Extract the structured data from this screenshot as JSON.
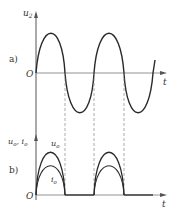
{
  "figure": {
    "panel_a": {
      "label": "a)",
      "y_axis_label": "u",
      "y_axis_sub": "2",
      "x_axis_label": "t",
      "origin_label": "O"
    },
    "panel_b": {
      "label": "b)",
      "y_axis_label": "u",
      "y_axis_sub": "o",
      "y_axis_sep": ", ",
      "y_axis_label2": "i",
      "y_axis_sub2": "o",
      "x_axis_label": "t",
      "origin_label": "O",
      "curve1_label": "u",
      "curve1_sub": "o",
      "curve2_label": "i",
      "curve2_sub": "o"
    },
    "colors": {
      "curve": "#2a2a2a",
      "axis": "#555555",
      "dashed": "#888888"
    }
  }
}
